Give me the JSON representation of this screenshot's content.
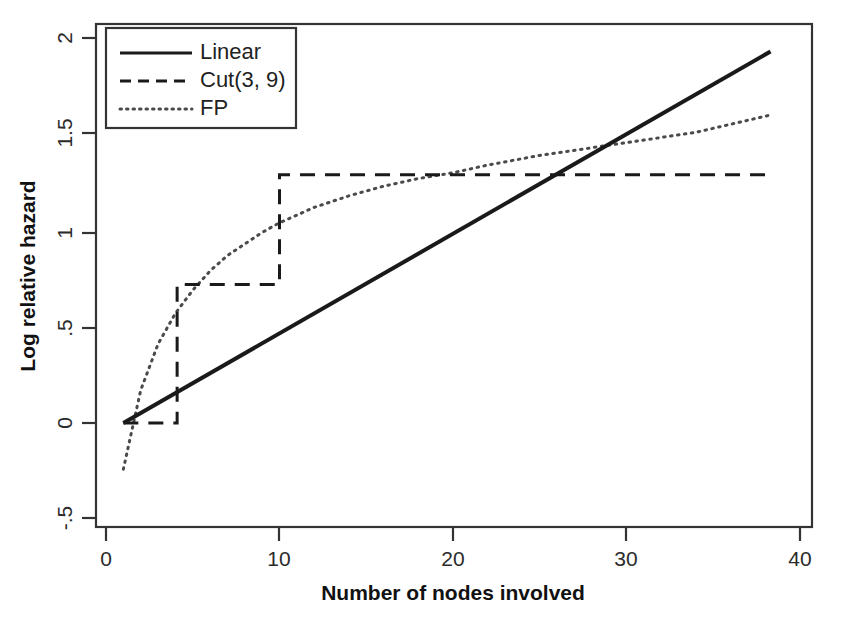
{
  "chart_data": {
    "type": "line",
    "title": "",
    "xlabel": "Number of nodes involved",
    "ylabel": "Log relative hazard",
    "xlim": [
      0,
      40
    ],
    "ylim": [
      -0.5,
      2.0
    ],
    "xticks": [
      0,
      10,
      20,
      30,
      40
    ],
    "xticklabels": [
      "0",
      "10",
      "20",
      "30",
      "40"
    ],
    "yticks": [
      -0.5,
      0,
      0.5,
      1,
      1.5,
      2
    ],
    "yticklabels": [
      "-.5",
      "0",
      ".5",
      "1",
      "1.5",
      "2"
    ],
    "grid": false,
    "legend_position": "top-left",
    "series": [
      {
        "name": "Linear",
        "style": "solid",
        "color": "#1a1a1a",
        "x": [
          1,
          38.3
        ],
        "y": [
          0.0,
          1.93
        ],
        "note": "straight line, slope about 0.0517 per node"
      },
      {
        "name": "Cut(3, 9)",
        "style": "dashed",
        "color": "#1a1a1a",
        "step_x": [
          1,
          4.1,
          4.1,
          10.0,
          10.0,
          38.3
        ],
        "step_y": [
          0.0,
          0.0,
          0.72,
          0.72,
          1.29,
          1.29
        ],
        "levels": [
          0.0,
          0.72,
          1.29
        ],
        "cutpoints": [
          4.1,
          10.0
        ],
        "note": "step function with jumps at 4 and 10 nodes"
      },
      {
        "name": "FP",
        "style": "dotted",
        "color": "#4a4a4a",
        "x": [
          1,
          2,
          3,
          4,
          5,
          6,
          7,
          8,
          9,
          10,
          12,
          14,
          16,
          18,
          20,
          22,
          25,
          28,
          31,
          34,
          38.3
        ],
        "y": [
          -0.24,
          0.17,
          0.41,
          0.57,
          0.69,
          0.79,
          0.87,
          0.93,
          0.99,
          1.04,
          1.12,
          1.18,
          1.23,
          1.27,
          1.3,
          1.34,
          1.39,
          1.43,
          1.47,
          1.51,
          1.6
        ],
        "note": "fractional polynomial, concave increasing curve"
      }
    ]
  },
  "legend": {
    "entries": [
      {
        "label": "Linear",
        "style": "solid"
      },
      {
        "label": "Cut(3, 9)",
        "style": "dashed"
      },
      {
        "label": "FP",
        "style": "dotted"
      }
    ]
  },
  "axes": {
    "x_title": "Number of nodes involved",
    "y_title": "Log relative hazard",
    "x_tick_0": "0",
    "x_tick_1": "10",
    "x_tick_2": "20",
    "x_tick_3": "30",
    "x_tick_4": "40",
    "y_tick_0": "-.5",
    "y_tick_1": "0",
    "y_tick_2": ".5",
    "y_tick_3": "1",
    "y_tick_4": "1.5",
    "y_tick_5": "2"
  },
  "colors": {
    "background": "#ffffff",
    "axis": "#333333",
    "solid_line": "#1a1a1a",
    "dashed_line": "#1a1a1a",
    "dotted_line": "#4a4a4a"
  }
}
